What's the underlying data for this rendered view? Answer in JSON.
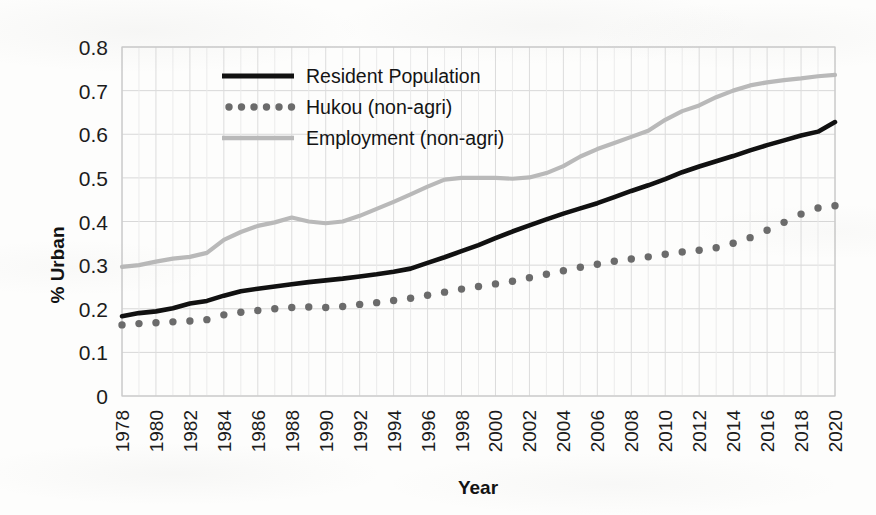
{
  "chart_data": {
    "type": "line",
    "title": "",
    "xlabel": "Year",
    "ylabel": "% Urban",
    "xlim": [
      1978,
      2020
    ],
    "ylim": [
      0,
      0.8
    ],
    "grid": true,
    "legend_position": "top-left-inside",
    "y_ticks": [
      "0",
      "0.1",
      "0.2",
      "0.3",
      "0.4",
      "0.5",
      "0.6",
      "0.7",
      "0.8"
    ],
    "y_tick_values": [
      0,
      0.1,
      0.2,
      0.3,
      0.4,
      0.5,
      0.6,
      0.7,
      0.8
    ],
    "x_ticks": [
      "1978",
      "1980",
      "1982",
      "1984",
      "1986",
      "1988",
      "1990",
      "1992",
      "1994",
      "1996",
      "1998",
      "2000",
      "2002",
      "2004",
      "2006",
      "2008",
      "2010",
      "2012",
      "2014",
      "2016",
      "2018",
      "2020"
    ],
    "x": [
      1978,
      1979,
      1980,
      1981,
      1982,
      1983,
      1984,
      1985,
      1986,
      1987,
      1988,
      1989,
      1990,
      1991,
      1992,
      1993,
      1994,
      1995,
      1996,
      1997,
      1998,
      1999,
      2000,
      2001,
      2002,
      2003,
      2004,
      2005,
      2006,
      2007,
      2008,
      2009,
      2010,
      2011,
      2012,
      2013,
      2014,
      2015,
      2016,
      2017,
      2018,
      2019,
      2020
    ],
    "series": [
      {
        "name": "Resident Population",
        "style": "solid",
        "color": "#111111",
        "values": [
          0.183,
          0.19,
          0.194,
          0.201,
          0.212,
          0.218,
          0.23,
          0.24,
          0.246,
          0.251,
          0.256,
          0.261,
          0.265,
          0.269,
          0.274,
          0.279,
          0.285,
          0.292,
          0.305,
          0.318,
          0.332,
          0.346,
          0.362,
          0.377,
          0.391,
          0.405,
          0.418,
          0.43,
          0.442,
          0.456,
          0.47,
          0.483,
          0.497,
          0.513,
          0.526,
          0.538,
          0.55,
          0.563,
          0.575,
          0.586,
          0.597,
          0.606,
          0.628
        ]
      },
      {
        "name": "Hukou (non-agri)",
        "style": "dotted",
        "color": "#6b6b6b",
        "values": [
          0.163,
          0.166,
          0.168,
          0.17,
          0.172,
          0.175,
          0.186,
          0.192,
          0.196,
          0.2,
          0.203,
          0.204,
          0.203,
          0.205,
          0.21,
          0.214,
          0.219,
          0.224,
          0.231,
          0.238,
          0.245,
          0.251,
          0.257,
          0.263,
          0.271,
          0.279,
          0.287,
          0.295,
          0.302,
          0.309,
          0.314,
          0.319,
          0.325,
          0.33,
          0.334,
          0.34,
          0.35,
          0.363,
          0.38,
          0.398,
          0.417,
          0.431,
          0.436
        ]
      },
      {
        "name": "Employment (non-agri)",
        "style": "solid-light",
        "color": "#b9b9b9",
        "values": [
          0.296,
          0.3,
          0.308,
          0.315,
          0.319,
          0.328,
          0.358,
          0.376,
          0.39,
          0.398,
          0.409,
          0.4,
          0.396,
          0.4,
          0.413,
          0.429,
          0.445,
          0.462,
          0.48,
          0.496,
          0.5,
          0.5,
          0.5,
          0.498,
          0.501,
          0.511,
          0.527,
          0.549,
          0.566,
          0.58,
          0.594,
          0.608,
          0.633,
          0.653,
          0.666,
          0.685,
          0.7,
          0.712,
          0.719,
          0.724,
          0.728,
          0.733,
          0.736
        ]
      }
    ],
    "legend": [
      {
        "label": "Resident Population",
        "style": "solid",
        "color": "#111111"
      },
      {
        "label": "Hukou (non-agri)",
        "style": "dotted",
        "color": "#6b6b6b"
      },
      {
        "label": "Employment (non-agri)",
        "style": "solid-light",
        "color": "#b9b9b9"
      }
    ]
  }
}
